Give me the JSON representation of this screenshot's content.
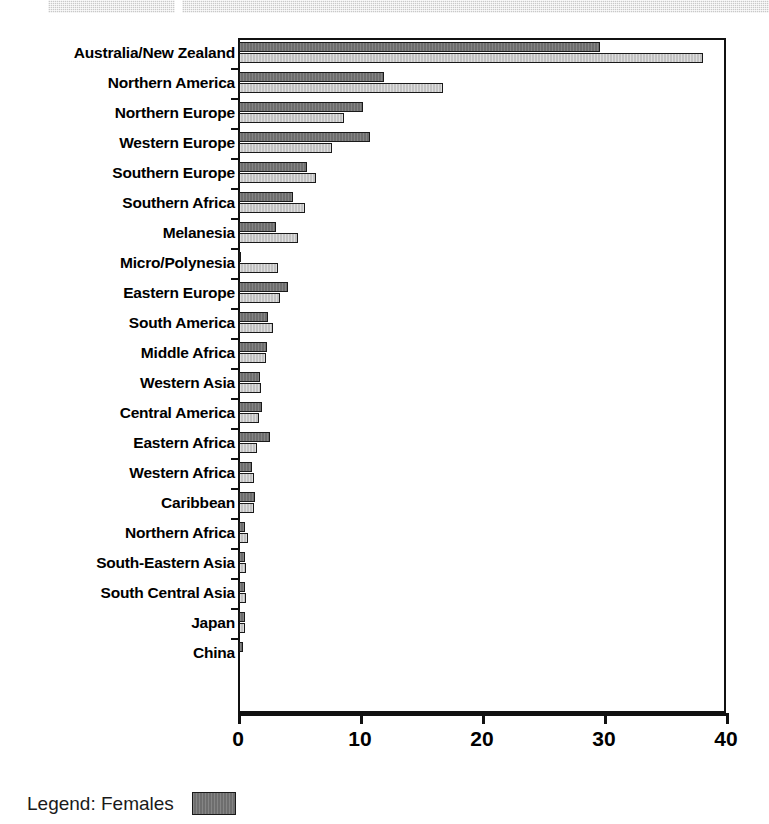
{
  "top_band": {
    "left_segment": "scan-artifact-strip",
    "right_segment": "scan-artifact-strip"
  },
  "legend": {
    "text": "Legend: Females",
    "swatch_color": "#6e6e6e"
  },
  "colors": {
    "females": "#6e6e6e",
    "males": "#c2c2c2",
    "axis": "#111111",
    "background": "#ffffff"
  },
  "chart_data": {
    "type": "bar",
    "orientation": "horizontal",
    "title": "",
    "subtitle": "",
    "xlabel": "",
    "ylabel": "",
    "xlim": [
      0,
      40
    ],
    "xticks": [
      0,
      10,
      20,
      30,
      40
    ],
    "xticklabels": [
      "0",
      "10",
      "20",
      "30",
      "40"
    ],
    "grid": false,
    "legend_position": "below-left",
    "categories": [
      "Australia/New Zealand",
      "Northern America",
      "Northern Europe",
      "Western Europe",
      "Southern Europe",
      "Southern Africa",
      "Melanesia",
      "Micro/Polynesia",
      "Eastern Europe",
      "South America",
      "Middle Africa",
      "Western Asia",
      "Central America",
      "Eastern Africa",
      "Western Africa",
      "Caribbean",
      "Northern Africa",
      "South-Eastern Asia",
      "South Central Asia",
      "Japan",
      "China"
    ],
    "series": [
      {
        "name": "Females",
        "color": "#6e6e6e",
        "values": [
          29.6,
          11.9,
          10.2,
          10.7,
          5.6,
          4.4,
          3.0,
          0.2,
          4.0,
          2.4,
          2.3,
          1.7,
          1.9,
          2.5,
          1.1,
          1.3,
          0.5,
          0.5,
          0.5,
          0.5,
          0.3
        ]
      },
      {
        "name": "Males",
        "color": "#c2c2c2",
        "values": [
          38.0,
          16.7,
          8.6,
          7.6,
          6.3,
          5.4,
          4.8,
          3.2,
          3.4,
          2.8,
          2.2,
          1.8,
          1.6,
          1.5,
          1.2,
          1.2,
          0.7,
          0.6,
          0.6,
          0.5,
          0.0
        ]
      }
    ]
  }
}
